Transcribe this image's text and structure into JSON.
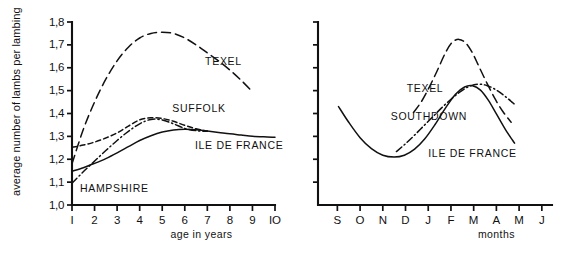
{
  "figure": {
    "background_color": "#ffffff",
    "ink_color": "#111111"
  },
  "chart_data": [
    {
      "id": "left",
      "type": "line",
      "title": "",
      "xlabel": "age in years",
      "ylabel": "average number of lambs per lambing",
      "xlim": [
        1,
        10
      ],
      "ylim": [
        1.0,
        1.8
      ],
      "grid": false,
      "legend_position": "inline-annotations",
      "xtick_labels": [
        "I",
        "2",
        "3",
        "4",
        "5",
        "6",
        "7",
        "8",
        "9",
        "IO"
      ],
      "xtick_values": [
        1,
        2,
        3,
        4,
        5,
        6,
        7,
        8,
        9,
        10
      ],
      "ytick_labels": [
        "1,0",
        "1,1",
        "1,2",
        "1,3",
        "1,4",
        "1,5",
        "1,6",
        "1,7",
        "1,8"
      ],
      "ytick_values": [
        1.0,
        1.1,
        1.2,
        1.3,
        1.4,
        1.5,
        1.6,
        1.7,
        1.8
      ],
      "series": [
        {
          "name": "TEXEL",
          "style": "long-dash",
          "label_x": 6.9,
          "label_y": 1.61,
          "x": [
            1,
            1.5,
            2,
            2.5,
            3,
            3.5,
            4,
            4.5,
            5,
            5.5,
            6,
            6.5,
            7,
            7.5,
            8,
            8.5,
            9
          ],
          "values": [
            1.18,
            1.33,
            1.45,
            1.55,
            1.63,
            1.69,
            1.73,
            1.75,
            1.755,
            1.75,
            1.73,
            1.7,
            1.665,
            1.63,
            1.59,
            1.545,
            1.495
          ]
        },
        {
          "name": "SUFFOLK",
          "style": "short-dash",
          "label_x": 5.45,
          "label_y": 1.405,
          "x": [
            1,
            1.5,
            2,
            2.5,
            3,
            3.5,
            4,
            4.5,
            5,
            5.5,
            6,
            6.5,
            7
          ],
          "values": [
            1.252,
            1.262,
            1.275,
            1.293,
            1.315,
            1.345,
            1.372,
            1.381,
            1.378,
            1.366,
            1.348,
            1.333,
            1.322
          ]
        },
        {
          "name": "HAMPSHIRE",
          "style": "dash-dot",
          "label_x": 1.35,
          "label_y": 1.055,
          "x": [
            1,
            1.5,
            2,
            2.5,
            3,
            3.5,
            4,
            4.5,
            5,
            5.5,
            6,
            6.5,
            7
          ],
          "values": [
            1.095,
            1.145,
            1.192,
            1.238,
            1.282,
            1.322,
            1.355,
            1.374,
            1.372,
            1.355,
            1.335,
            1.325,
            1.322
          ]
        },
        {
          "name": "ILE DE FRANCE",
          "style": "solid",
          "label_x": 6.45,
          "label_y": 1.245,
          "x": [
            1,
            1.5,
            2,
            2.5,
            3,
            3.5,
            4,
            4.5,
            5,
            5.5,
            6,
            6.5,
            7,
            7.5,
            8,
            8.5,
            9,
            9.5,
            10
          ],
          "values": [
            1.148,
            1.163,
            1.182,
            1.203,
            1.228,
            1.255,
            1.282,
            1.303,
            1.319,
            1.328,
            1.331,
            1.329,
            1.323,
            1.317,
            1.311,
            1.306,
            1.301,
            1.298,
            1.296
          ]
        }
      ]
    },
    {
      "id": "right",
      "type": "line",
      "title": "",
      "xlabel": "months",
      "ylabel": "",
      "grid": false,
      "legend_position": "inline-annotations",
      "xtick_labels": [
        "S",
        "O",
        "N",
        "D",
        "J",
        "F",
        "M",
        "A",
        "M",
        "J"
      ],
      "ytick_count": 8,
      "ytick_labels": [],
      "series": [
        {
          "name": "TEXEL",
          "style": "long-dash",
          "label_x": 4.05,
          "label_y": 0.615,
          "x": [
            4.35,
            4.7,
            5.05,
            5.4,
            5.75,
            6.05,
            6.35,
            6.65,
            6.95,
            7.25,
            7.6,
            7.95,
            8.3,
            8.65
          ],
          "values": [
            0.505,
            0.565,
            0.645,
            0.735,
            0.83,
            0.888,
            0.905,
            0.885,
            0.83,
            0.752,
            0.662,
            0.578,
            0.508,
            0.452
          ]
        },
        {
          "name": "SOUTHDOWN",
          "style": "dash-dot",
          "label_x": 3.35,
          "label_y": 0.462,
          "x": [
            3.6,
            4.0,
            4.4,
            4.8,
            5.2,
            5.6,
            6.0,
            6.4,
            6.8,
            7.2,
            7.6,
            8.0,
            8.4,
            8.85
          ],
          "values": [
            0.292,
            0.335,
            0.382,
            0.432,
            0.482,
            0.532,
            0.578,
            0.618,
            0.648,
            0.66,
            0.652,
            0.628,
            0.592,
            0.545
          ]
        },
        {
          "name": "ILE DE FRANCE",
          "style": "solid",
          "label_x": 5.0,
          "label_y": 0.262,
          "x": [
            1.05,
            1.5,
            2.0,
            2.5,
            3.0,
            3.5,
            3.95,
            4.4,
            4.85,
            5.3,
            5.75,
            6.2,
            6.6,
            6.95,
            7.3,
            7.65,
            8.0,
            8.4,
            8.8
          ],
          "values": [
            0.538,
            0.452,
            0.368,
            0.308,
            0.272,
            0.262,
            0.272,
            0.305,
            0.362,
            0.44,
            0.528,
            0.605,
            0.645,
            0.652,
            0.628,
            0.572,
            0.498,
            0.412,
            0.338
          ]
        }
      ]
    }
  ]
}
